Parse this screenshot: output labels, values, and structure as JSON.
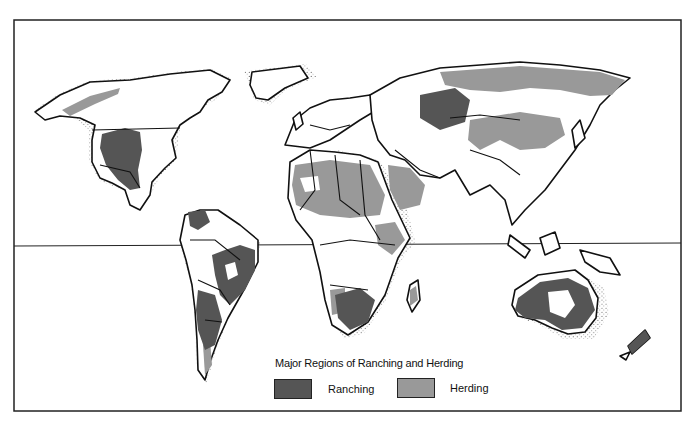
{
  "map": {
    "title": "Major Regions of Ranching and Herding",
    "equator_line": true,
    "legend": [
      {
        "label": "Ranching",
        "color": "#555555"
      },
      {
        "label": "Herding",
        "color": "#999999"
      }
    ],
    "colors": {
      "ranching": "#555555",
      "herding": "#999999",
      "land": "#ffffff",
      "outline": "#111111",
      "frame": "#222222"
    },
    "regions": {
      "ranching": [
        "Western United States & Mexico",
        "Northern South America (Venezuela)",
        "Brazil",
        "Argentina/Uruguay",
        "Southern Africa",
        "Central Asia (Kazakhstan)",
        "Australia",
        "New Zealand"
      ],
      "herding": [
        "Arctic Canada/Alaska",
        "Northern Russia/Siberia",
        "Mongolia & Western China",
        "Sahel & North Africa",
        "Arabian Peninsula & Middle East",
        "East Africa",
        "Madagascar",
        "Patagonia"
      ]
    }
  }
}
